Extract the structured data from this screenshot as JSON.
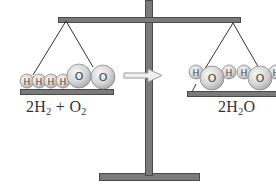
{
  "diagram": {
    "left_pan": {
      "label_parts": [
        "2H",
        "2",
        " + O",
        "2"
      ],
      "atoms": [
        {
          "symbol": "H",
          "cx": 27,
          "cy": 81,
          "r": 7
        },
        {
          "symbol": "H",
          "cx": 39,
          "cy": 81,
          "r": 7
        },
        {
          "symbol": "H",
          "cx": 51,
          "cy": 81,
          "r": 7
        },
        {
          "symbol": "H",
          "cx": 63,
          "cy": 81,
          "r": 7
        },
        {
          "symbol": "O",
          "cx": 79,
          "cy": 76,
          "r": 12
        },
        {
          "symbol": "O",
          "cx": 103,
          "cy": 77,
          "r": 12
        }
      ]
    },
    "right_pan": {
      "label_parts": [
        "2H",
        "2",
        "O"
      ],
      "atoms": [
        {
          "symbol": "H",
          "cx": 196,
          "cy": 72,
          "r": 7
        },
        {
          "symbol": "O",
          "cx": 212,
          "cy": 78,
          "r": 12
        },
        {
          "symbol": "H",
          "cx": 229,
          "cy": 72,
          "r": 7
        },
        {
          "symbol": "H",
          "cx": 244,
          "cy": 72,
          "r": 7
        },
        {
          "symbol": "O",
          "cx": 260,
          "cy": 78,
          "r": 12
        },
        {
          "symbol": "H",
          "cx": 276,
          "cy": 72,
          "r": 7
        }
      ]
    },
    "arrow": {
      "direction": "right",
      "meaning": "reacts to form"
    },
    "colors": {
      "metal": "#7a7a7a",
      "metal_edge": "#4a4a4a",
      "atom_fill": "#d9d9d9",
      "atom_light": "#f6f6f6",
      "atom_edge": "#8a8a8a",
      "text": "#333333"
    }
  }
}
